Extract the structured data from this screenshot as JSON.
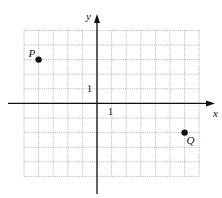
{
  "diagram": {
    "type": "coordinate-plane",
    "x_axis_label": "x",
    "y_axis_label": "y",
    "x_tick_label": "1",
    "y_tick_label": "1",
    "grid": {
      "x_min": -5,
      "x_max": 7,
      "y_min": -5,
      "y_max": 5
    },
    "points": [
      {
        "label": "P",
        "x": -4,
        "y": 3
      },
      {
        "label": "Q",
        "x": 6,
        "y": -2
      }
    ],
    "colors": {
      "grid": "#9a9a9a",
      "axis": "#111111",
      "point": "#111111"
    }
  }
}
